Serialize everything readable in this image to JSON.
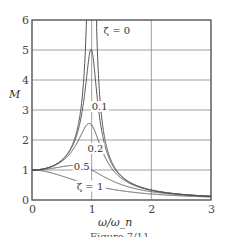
{
  "chart_data": {
    "type": "line",
    "title": "",
    "xlabel": "ω/ω_n",
    "ylabel": "M",
    "xlim": [
      0,
      3
    ],
    "ylim": [
      0,
      6
    ],
    "grid": true,
    "x_ticks": [
      "0",
      "1",
      "2",
      "3"
    ],
    "y_ticks": [
      "0",
      "1",
      "2",
      "3",
      "4",
      "5",
      "6"
    ],
    "formula": "M = 1 / sqrt((1 - r^2)^2 + (2*zeta*r)^2), r = ω/ω_n",
    "series": [
      {
        "name": "ζ = 0",
        "zeta": 0.0,
        "peak": "∞ at r = 1"
      },
      {
        "name": "0.1",
        "zeta": 0.1,
        "peak": 5.0
      },
      {
        "name": "0.2",
        "zeta": 0.2,
        "peak": 2.5
      },
      {
        "name": "0.5",
        "zeta": 0.5,
        "peak": 1.15
      },
      {
        "name": "ζ = 1",
        "zeta": 1.0,
        "peak": 1.0
      }
    ],
    "annotations": [
      {
        "text": "ζ = 0",
        "x": 1.2,
        "y": 5.55
      },
      {
        "text": "0.1",
        "x": 1.0,
        "y": 3.0
      },
      {
        "text": "0.2",
        "x": 0.93,
        "y": 1.6
      },
      {
        "text": "0.5",
        "x": 0.7,
        "y": 1.0
      },
      {
        "text": "ζ = 1",
        "x": 0.75,
        "y": 0.35
      }
    ]
  },
  "caption": "Figure 7/11"
}
